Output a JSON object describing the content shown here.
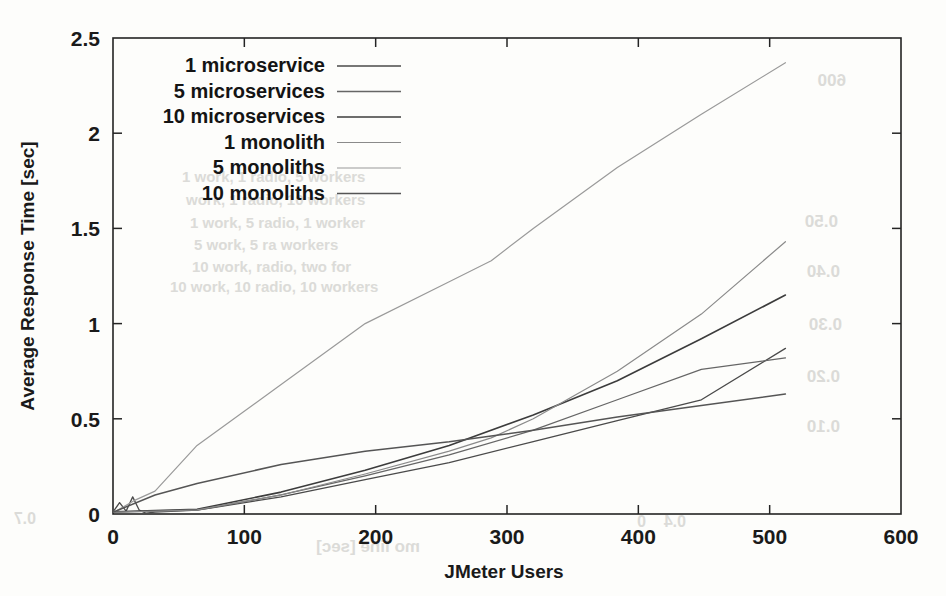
{
  "figure": {
    "kind": "scanned-line-chart",
    "background_color": "#fdfdfb",
    "ink_color": "#1a1a1a"
  },
  "chart_data": {
    "type": "line",
    "title": "",
    "xlabel": "JMeter Users",
    "ylabel": "Average Response Time [sec]",
    "xlim": [
      0,
      600
    ],
    "ylim": [
      0,
      2.5
    ],
    "xticks": [
      0,
      100,
      200,
      300,
      400,
      500,
      600
    ],
    "yticks": [
      0,
      0.5,
      1,
      1.5,
      2,
      2.5
    ],
    "xtick_labels": [
      "0",
      "100",
      "200",
      "300",
      "400",
      "500",
      "600"
    ],
    "ytick_labels": [
      "0",
      "0.5",
      "1",
      "1.5",
      "2",
      "2.5"
    ],
    "grid": false,
    "legend_position": "top-left",
    "series": [
      {
        "name": "1 microservice",
        "color": "#4a4a4a",
        "width": 1.3,
        "x": [
          1,
          5,
          10,
          15,
          20,
          25,
          32,
          64,
          128,
          192,
          256,
          320,
          384,
          448,
          512
        ],
        "y": [
          0.02,
          0.06,
          0.015,
          0.09,
          0.02,
          0.005,
          0.01,
          0.02,
          0.09,
          0.18,
          0.27,
          0.38,
          0.49,
          0.6,
          0.87
        ]
      },
      {
        "name": "5 microservices",
        "color": "#666666",
        "width": 1.3,
        "x": [
          1,
          32,
          64,
          128,
          192,
          256,
          320,
          384,
          448,
          512
        ],
        "y": [
          0.01,
          0.015,
          0.02,
          0.1,
          0.2,
          0.31,
          0.44,
          0.6,
          0.76,
          0.82
        ]
      },
      {
        "name": "10 microservices",
        "color": "#3c3c3c",
        "width": 1.6,
        "x": [
          1,
          32,
          64,
          128,
          192,
          256,
          320,
          384,
          448,
          512
        ],
        "y": [
          0.012,
          0.018,
          0.025,
          0.115,
          0.23,
          0.36,
          0.52,
          0.7,
          0.92,
          1.15
        ]
      },
      {
        "name": "1 monolith",
        "color": "#8a8a8a",
        "width": 1.2,
        "x": [
          1,
          32,
          64,
          128,
          192,
          256,
          288,
          320,
          384,
          448,
          512
        ],
        "y": [
          0.01,
          0.015,
          0.022,
          0.1,
          0.21,
          0.33,
          0.4,
          0.5,
          0.75,
          1.05,
          1.43
        ]
      },
      {
        "name": "5 monoliths",
        "color": "#9a9a9a",
        "width": 1.2,
        "x": [
          1,
          16,
          32,
          64,
          96,
          128,
          192,
          256,
          288,
          320,
          384,
          448,
          512
        ],
        "y": [
          0.01,
          0.07,
          0.12,
          0.36,
          0.52,
          0.68,
          1.0,
          1.22,
          1.33,
          1.5,
          1.82,
          2.1,
          2.37
        ]
      },
      {
        "name": "10 monoliths",
        "color": "#555555",
        "width": 1.5,
        "x": [
          1,
          32,
          64,
          128,
          192,
          256,
          288,
          320,
          384,
          448,
          512
        ],
        "y": [
          0.012,
          0.1,
          0.16,
          0.26,
          0.33,
          0.38,
          0.41,
          0.44,
          0.51,
          0.57,
          0.63
        ]
      }
    ]
  },
  "legend": {
    "entries": [
      {
        "label": "1 microservice"
      },
      {
        "label": "5 microservices"
      },
      {
        "label": "10 microservices"
      },
      {
        "label": "1 monolith"
      },
      {
        "label": "5 monoliths"
      },
      {
        "label": "10 monoliths"
      }
    ]
  },
  "ghost_text": [
    {
      "text": "600",
      "x": 846,
      "y": 86,
      "size": 17,
      "flip": true
    },
    {
      "text": "0.50",
      "x": 838,
      "y": 227,
      "size": 17,
      "flip": true
    },
    {
      "text": "0.40",
      "x": 840,
      "y": 277,
      "size": 17,
      "flip": true
    },
    {
      "text": "0.30",
      "x": 842,
      "y": 330,
      "size": 17,
      "flip": true
    },
    {
      "text": "0.20",
      "x": 840,
      "y": 382,
      "size": 17,
      "flip": true
    },
    {
      "text": "0.10",
      "x": 840,
      "y": 432,
      "size": 17,
      "flip": true
    },
    {
      "text": "1 work, 1 radio, 5 workers",
      "x": 182,
      "y": 182,
      "size": 15,
      "flip": false
    },
    {
      "text": "work, 1 radio, 10 workers",
      "x": 186,
      "y": 205,
      "size": 15,
      "flip": false
    },
    {
      "text": "1 work, 5 radio, 1 worker",
      "x": 190,
      "y": 228,
      "size": 15,
      "flip": false
    },
    {
      "text": "5 work, 5 ra      workers",
      "x": 194,
      "y": 250,
      "size": 15,
      "flip": false
    },
    {
      "text": "10 work, radio, two for",
      "x": 192,
      "y": 272,
      "size": 15,
      "flip": false
    },
    {
      "text": "10 work, 10 radio, 10 workers",
      "x": 170,
      "y": 292,
      "size": 15,
      "flip": false
    },
    {
      "text": "0.7",
      "x": 36,
      "y": 524,
      "size": 16,
      "flip": true
    },
    {
      "text": "mo line [sec]",
      "x": 420,
      "y": 552,
      "size": 17,
      "flip": true
    },
    {
      "text": "0",
      "x": 646,
      "y": 527,
      "size": 16,
      "flip": true
    },
    {
      "text": "0.4",
      "x": 686,
      "y": 527,
      "size": 16,
      "flip": true
    }
  ]
}
